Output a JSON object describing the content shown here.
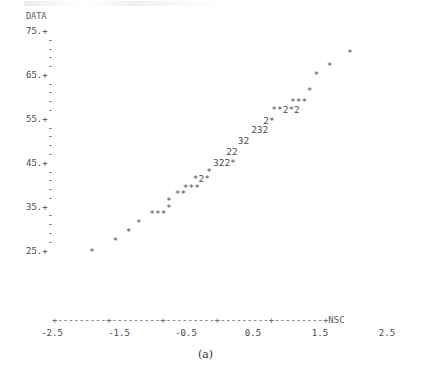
{
  "figure": {
    "caption": "(a)",
    "ylabel": "DATA",
    "xlabel": "NSC"
  },
  "axes": {
    "y_tick_labels": [
      "75.+",
      "65.+",
      "55.+",
      "45.+",
      "35.+",
      "25.+"
    ],
    "y_minor_mark": "-",
    "x_axis_line": "+---------+---------+---------+---------+---------+NSC",
    "x_tick_labels": [
      "-2.5",
      "-1.5",
      "-0.5",
      "0.5",
      "1.5",
      "2.5"
    ]
  },
  "chart_data": {
    "type": "scatter",
    "title": "",
    "subtitle": "",
    "xlabel": "NSC",
    "ylabel": "DATA",
    "xlim": [
      -2.5,
      2.5
    ],
    "ylim": [
      25,
      75
    ],
    "xticks": [
      -2.5,
      -1.5,
      -0.5,
      0.5,
      1.5,
      2.5
    ],
    "yticks": [
      25,
      35,
      45,
      55,
      65,
      75
    ],
    "grid": false,
    "legend": null,
    "symbols": {
      "*": 1,
      "2": 2,
      "3": 3
    },
    "rows": [
      {
        "text": "*",
        "x": 1.85,
        "y": 71.5
      },
      {
        "text": "*",
        "x": 1.55,
        "y": 68.5
      },
      {
        "text": "*",
        "x": 1.35,
        "y": 66.5
      },
      {
        "text": "*",
        "x": 1.25,
        "y": 63.0
      },
      {
        "text": "***",
        "x": 1.0,
        "y": 60.5
      },
      {
        "text": "**2*2",
        "x": 0.72,
        "y": 58.5
      },
      {
        "text": "2*",
        "x": 0.6,
        "y": 56.0
      },
      {
        "text": "232",
        "x": 0.42,
        "y": 54.0
      },
      {
        "text": "32",
        "x": 0.22,
        "y": 51.5
      },
      {
        "text": "22",
        "x": 0.05,
        "y": 49.0
      },
      {
        "text": "322*",
        "x": -0.15,
        "y": 46.5
      },
      {
        "text": "*",
        "x": -0.25,
        "y": 44.5
      },
      {
        "text": "*2*",
        "x": -0.45,
        "y": 43.0
      },
      {
        "text": "***",
        "x": -0.6,
        "y": 41.0
      },
      {
        "text": "**",
        "x": -0.72,
        "y": 39.5
      },
      {
        "text": "*",
        "x": -0.85,
        "y": 38.0
      },
      {
        "text": "*",
        "x": -0.85,
        "y": 36.5
      },
      {
        "text": "***",
        "x": -1.1,
        "y": 35.0
      },
      {
        "text": "*",
        "x": -1.3,
        "y": 33.0
      },
      {
        "text": "*",
        "x": -1.45,
        "y": 31.0
      },
      {
        "text": "*",
        "x": -1.65,
        "y": 29.0
      },
      {
        "text": "*",
        "x": -2.0,
        "y": 26.5
      }
    ]
  }
}
